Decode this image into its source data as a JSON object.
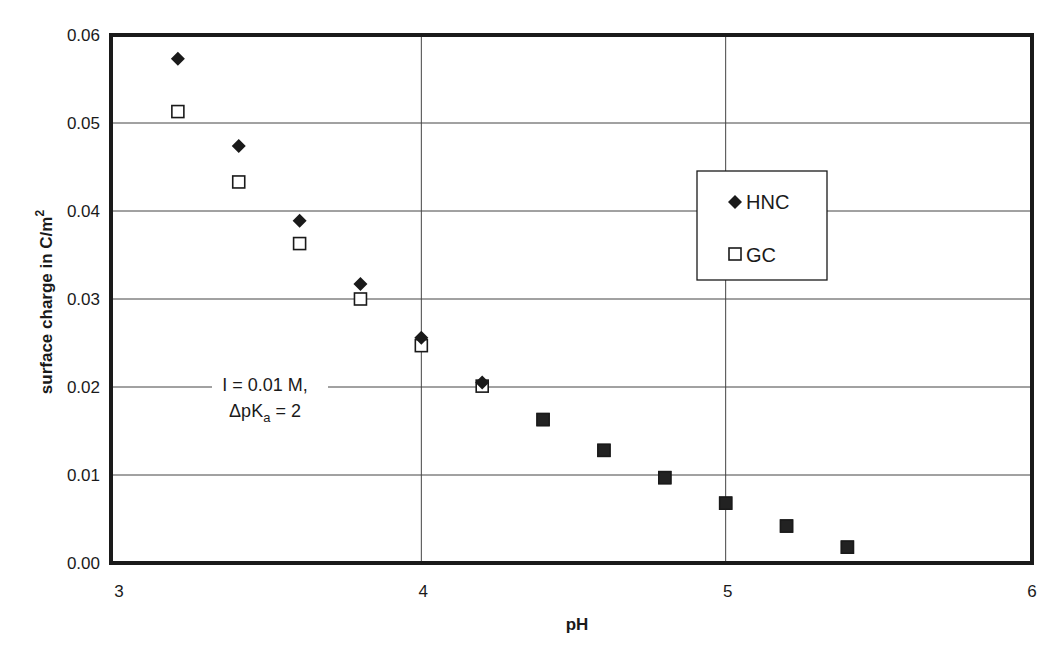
{
  "chart_data": {
    "type": "scatter",
    "title": "",
    "xlabel": "pH",
    "ylabel": "surface charge in C/m",
    "ylabel_superscript": "2",
    "xlim": [
      3,
      6
    ],
    "ylim": [
      0,
      0.06
    ],
    "xticks": [
      3,
      4,
      5,
      6
    ],
    "yticks": [
      0.0,
      0.01,
      0.02,
      0.03,
      0.04,
      0.05,
      0.06
    ],
    "xtick_labels": [
      "3",
      "4",
      "5",
      "6"
    ],
    "ytick_labels": [
      "0.00",
      "0.01",
      "0.02",
      "0.03",
      "0.04",
      "0.05",
      "0.06"
    ],
    "grid": true,
    "legend_position": "upper right (inset)",
    "annotation": {
      "line1": "I = 0.01 M,",
      "line2_prefix": "ΔpK",
      "line2_sub": "a",
      "line2_suffix": " = 2"
    },
    "series": [
      {
        "name": "HNC",
        "marker": "filled-diamond",
        "x": [
          3.2,
          3.4,
          3.6,
          3.8,
          4.0,
          4.2,
          4.4,
          4.6,
          4.8,
          5.0,
          5.2,
          5.4
        ],
        "values": [
          0.0573,
          0.0474,
          0.0389,
          0.0317,
          0.0256,
          0.0205,
          0.0163,
          0.0128,
          0.0097,
          0.0068,
          0.0042,
          0.0018
        ]
      },
      {
        "name": "GC",
        "marker": "open-square",
        "x": [
          3.2,
          3.4,
          3.6,
          3.8,
          4.0,
          4.2,
          4.4,
          4.6,
          4.8,
          5.0,
          5.2,
          5.4
        ],
        "values": [
          0.0513,
          0.0433,
          0.0363,
          0.03,
          0.0247,
          0.0201,
          0.0163,
          0.0128,
          0.0097,
          0.0068,
          0.0042,
          0.0018
        ]
      }
    ]
  },
  "colors": {
    "ink": "#1a1a1a",
    "grid": "#444444",
    "background": "#ffffff"
  }
}
